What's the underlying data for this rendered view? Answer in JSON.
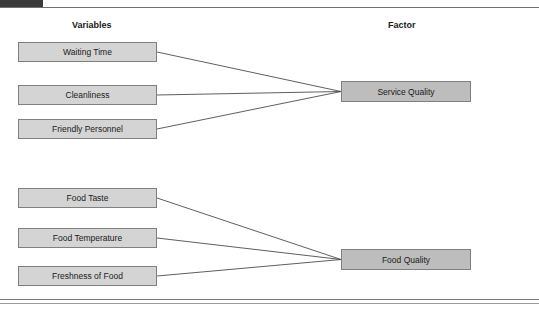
{
  "header": {
    "tab_label": "",
    "cropped_text": "",
    "title": ""
  },
  "columns": {
    "variables_label": "Variables",
    "factor_label": "Factor"
  },
  "colors": {
    "variable_fill": "#d4d4d4",
    "factor_fill": "#bdbdbd",
    "box_border": "#808080",
    "link_stroke": "#4d4d4d",
    "header_tab": "#3a3a3a",
    "text": "#1a1a1a"
  },
  "diagram": {
    "type": "factor-mapping",
    "groups": [
      {
        "factor": "Service Quality",
        "variables": [
          "Waiting Time",
          "Cleanliness",
          "Friendly Personnel"
        ]
      },
      {
        "factor": "Food Quality",
        "variables": [
          "Food Taste",
          "Food Temperature",
          "Freshness of Food"
        ]
      }
    ],
    "variables_flat": [
      "Waiting Time",
      "Cleanliness",
      "Friendly Personnel",
      "Food Taste",
      "Food Temperature",
      "Freshness of Food"
    ],
    "factors_flat": [
      "Service Quality",
      "Food Quality"
    ],
    "links": [
      {
        "from": "Waiting Time",
        "to": "Service Quality"
      },
      {
        "from": "Cleanliness",
        "to": "Service Quality"
      },
      {
        "from": "Friendly Personnel",
        "to": "Service Quality"
      },
      {
        "from": "Food Taste",
        "to": "Food Quality"
      },
      {
        "from": "Food Temperature",
        "to": "Food Quality"
      },
      {
        "from": "Freshness of Food",
        "to": "Food Quality"
      }
    ]
  }
}
